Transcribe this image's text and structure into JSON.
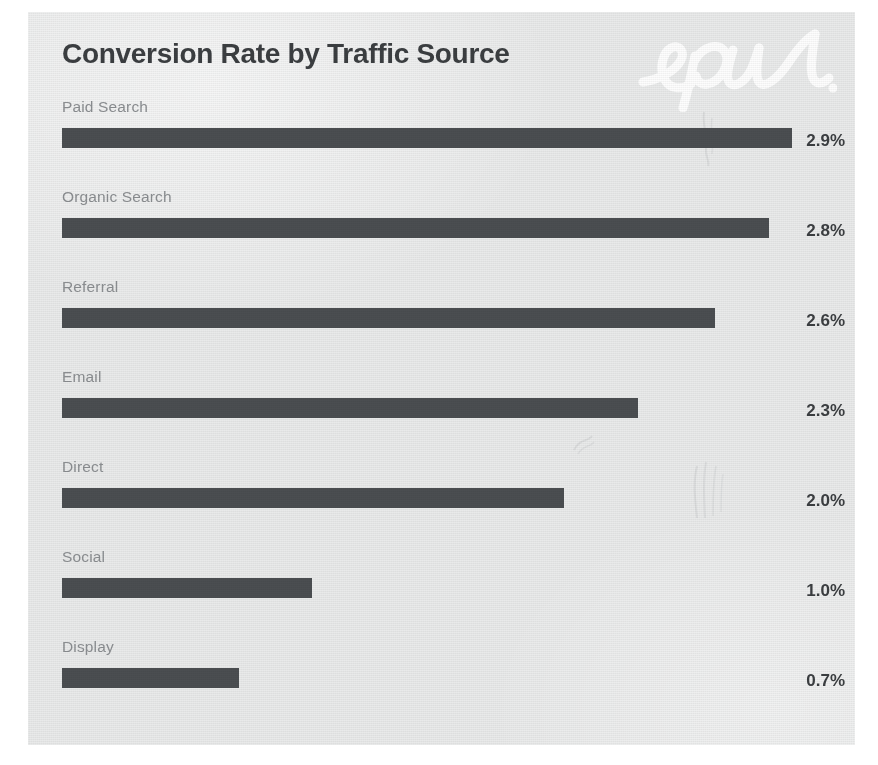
{
  "card": {
    "background_color": "#e9eaea",
    "page_background_color": "#ffffff"
  },
  "header": {
    "title": "Conversion Rate by Traffic Source",
    "title_color": "#3b3e41",
    "watermark_text": "epu",
    "watermark_color": "#ffffff"
  },
  "style": {
    "bar_color": "#4b4e51",
    "category_label_color": "#8b8e91",
    "value_label_color": "#3b3e41"
  },
  "chart_data": {
    "type": "bar",
    "orientation": "horizontal",
    "title": "Conversion Rate by Traffic Source",
    "xlabel": "",
    "ylabel": "",
    "unit": "%",
    "grid": false,
    "legend": "none",
    "xlim": [
      0,
      2.9
    ],
    "categories": [
      "Paid Search",
      "Organic Search",
      "Referral",
      "Email",
      "Direct",
      "Social",
      "Display"
    ],
    "values": [
      2.9,
      2.8,
      2.6,
      2.3,
      2.0,
      1.0,
      0.7
    ],
    "value_labels": [
      "2.9%",
      "2.8%",
      "2.6%",
      "2.3%",
      "2.0%",
      "1.0%",
      "0.7%"
    ],
    "bars": [
      {
        "label": "Paid Search",
        "value": 2.9,
        "value_label": "2.9%",
        "bar_pct": 100.0
      },
      {
        "label": "Organic Search",
        "value": 2.8,
        "value_label": "2.8%",
        "bar_pct": 96.8
      },
      {
        "label": "Referral",
        "value": 2.6,
        "value_label": "2.6%",
        "bar_pct": 89.4
      },
      {
        "label": "Email",
        "value": 2.3,
        "value_label": "2.3%",
        "bar_pct": 78.9
      },
      {
        "label": "Direct",
        "value": 2.0,
        "value_label": "2.0%",
        "bar_pct": 68.7
      },
      {
        "label": "Social",
        "value": 1.0,
        "value_label": "1.0%",
        "bar_pct": 34.2
      },
      {
        "label": "Display",
        "value": 0.7,
        "value_label": "0.7%",
        "bar_pct": 24.2
      }
    ]
  }
}
